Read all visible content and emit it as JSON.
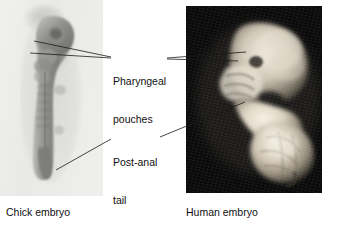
{
  "figure": {
    "type": "comparative-embryo-photo-figure",
    "background_color": "#ffffff",
    "width": 342,
    "height": 227
  },
  "panels": [
    {
      "id": "chick",
      "caption": "Chick embryo",
      "image_kind": "photograph",
      "subject": "chick embryo whole mount",
      "background_color": "#ededeb",
      "specimen_tone": "#8f8f8d"
    },
    {
      "id": "human",
      "caption": "Human embryo",
      "image_kind": "photograph",
      "subject": "human embryo specimen",
      "background_color": "#0b0b0b",
      "specimen_tone": "#ded8cc"
    }
  ],
  "callouts": [
    {
      "id": "pharyngeal-pouches",
      "line1": "Pharyngeal",
      "line2": "pouches",
      "points_to": [
        "chick",
        "human"
      ]
    },
    {
      "id": "post-anal-tail",
      "line1": "Post-anal",
      "line2": "tail",
      "points_to": [
        "chick",
        "human"
      ]
    }
  ],
  "style": {
    "text_color": "#100f0f",
    "leader_line_color": "#1a1a1a"
  }
}
